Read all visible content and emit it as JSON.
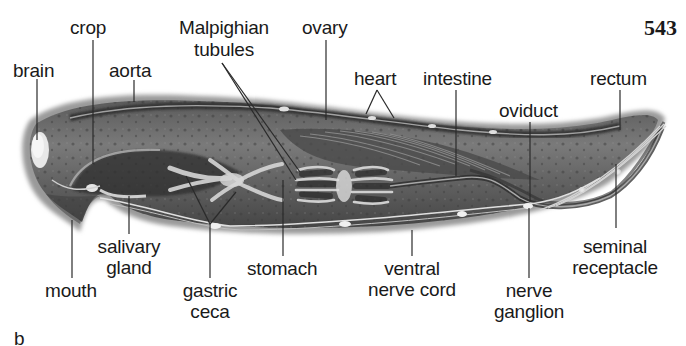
{
  "figure": {
    "page_number": "543",
    "panel_letter": "b",
    "colors": {
      "background": "#ffffff",
      "body_dark": "#3a3a3a",
      "body_mid": "#6e6e6e",
      "organ_light": "#cfcfcf",
      "leader_line": "#2a2a2a",
      "text": "#1a1a1a"
    }
  },
  "labels": {
    "crop": "crop",
    "malpighian_1": "Malpighian",
    "malpighian_2": "tubules",
    "ovary": "ovary",
    "brain": "brain",
    "aorta": "aorta",
    "heart": "heart",
    "intestine": "intestine",
    "rectum": "rectum",
    "oviduct": "oviduct",
    "salivary_1": "salivary",
    "salivary_2": "gland",
    "mouth": "mouth",
    "stomach": "stomach",
    "gastric_1": "gastric",
    "gastric_2": "ceca",
    "ventral_1": "ventral",
    "ventral_2": "nerve cord",
    "ganglion_1": "nerve",
    "ganglion_2": "ganglion",
    "seminal_1": "seminal",
    "seminal_2": "receptacle"
  }
}
